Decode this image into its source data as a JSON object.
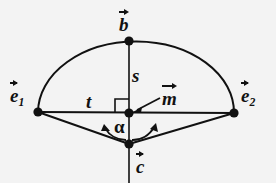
{
  "figure": {
    "kind": "geometry-diagram",
    "background_color": "#f3f3f3",
    "stroke_color": "#111111",
    "labels": {
      "b": "b",
      "e": "e",
      "e1_subscript": "1",
      "e2_subscript": "2",
      "m": "m",
      "c": "c",
      "s": "s",
      "t": "t",
      "alpha": "α"
    },
    "points": [
      {
        "name": "e1",
        "x": 38,
        "y": 112
      },
      {
        "name": "e2",
        "x": 234,
        "y": 113
      },
      {
        "name": "b",
        "x": 129,
        "y": 41
      },
      {
        "name": "c",
        "x": 129,
        "y": 144
      },
      {
        "name": "m",
        "x": 129,
        "y": 113
      }
    ],
    "segments": [
      {
        "name": "chord-e1-e2",
        "from": "e1",
        "to": "e2"
      },
      {
        "name": "radius-s-b-to-m",
        "from": "b",
        "to": "m"
      },
      {
        "name": "axis-m-to-c",
        "from": "m",
        "to": "c"
      },
      {
        "name": "leg-c-to-e1",
        "from": "c",
        "to": "e1"
      },
      {
        "name": "leg-c-to-e2",
        "from": "c",
        "to": "e2"
      }
    ],
    "arcs": [
      {
        "name": "semicircle-e1-b-e2",
        "through": [
          "e1",
          "b",
          "e2"
        ]
      },
      {
        "name": "angle-arc-left",
        "at": "c",
        "double_headed": true
      },
      {
        "name": "angle-arc-right",
        "at": "c",
        "double_headed": true
      }
    ],
    "markers": [
      {
        "name": "right-angle-marker",
        "at": "m",
        "quadrant": "upper-left"
      },
      {
        "name": "pointer-arrow-to-m",
        "from_label": "m",
        "to": "m"
      }
    ]
  }
}
